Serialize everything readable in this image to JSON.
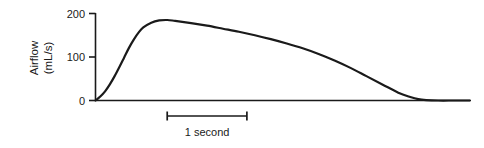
{
  "chart_data": {
    "type": "line",
    "title": "",
    "subtitle": "",
    "xlabel": "",
    "ylabel": "Airflow",
    "ylabel_units": "(mL/s)",
    "ylabel_lines": [
      "Airflow",
      "(mL/s)"
    ],
    "yticks": [
      0,
      100,
      200
    ],
    "ytick_labels": [
      "0",
      "100",
      "200"
    ],
    "ylim": [
      0,
      200
    ],
    "xlim": [
      0,
      4.7
    ],
    "grid": false,
    "legend": null,
    "legend_position": "none",
    "axis_style": "left-spine-only",
    "annotations": [
      {
        "name": "scale-bar",
        "label": "1 second",
        "x_start": 0.9,
        "x_end": 1.9,
        "span_seconds": 1
      }
    ],
    "series": [
      {
        "name": "Airflow waveform",
        "color": "#1a1a1a",
        "line_width": 2.2,
        "x": [
          0.0,
          0.06,
          0.12,
          0.18,
          0.24,
          0.3,
          0.36,
          0.42,
          0.48,
          0.54,
          0.6,
          0.7,
          0.8,
          0.9,
          1.0,
          1.2,
          1.4,
          1.6,
          1.8,
          2.0,
          2.2,
          2.4,
          2.6,
          2.8,
          3.0,
          3.2,
          3.4,
          3.6,
          3.8,
          3.95,
          4.05,
          4.15,
          4.3,
          4.5,
          4.7
        ],
        "y": [
          0,
          9,
          21,
          37,
          56,
          77,
          99,
          121,
          140,
          156,
          168,
          179,
          184,
          185,
          183,
          178,
          172,
          165,
          158,
          150,
          141,
          131,
          120,
          107,
          92,
          75,
          56,
          37,
          18,
          8,
          3,
          1,
          0,
          0,
          0
        ],
        "peak_value": 185,
        "peak_x": 0.9,
        "start_value": 0,
        "end_value": 0
      }
    ]
  },
  "figure": {
    "name": "airflow-waveform-figure",
    "background_color": "#ffffff",
    "foreground_color": "#1a1a1a"
  }
}
